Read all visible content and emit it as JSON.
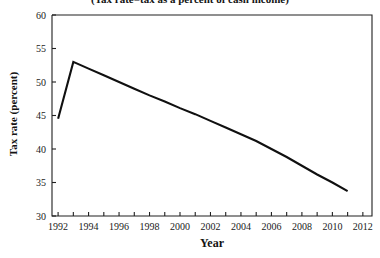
{
  "chart_data": {
    "type": "line",
    "title": "(Tax rate=tax as a percent of cash income)",
    "xlabel": "Year",
    "ylabel": "Tax rate (percent)",
    "xlim": [
      1991.6,
      2012.6
    ],
    "ylim": [
      30,
      60
    ],
    "yticks": [
      30,
      35,
      40,
      45,
      50,
      55,
      60
    ],
    "ytick_labels": [
      "30",
      "35",
      "40",
      "45",
      "50",
      "55",
      "60"
    ],
    "xticks": [
      1992,
      1993,
      1994,
      1995,
      1996,
      1997,
      1998,
      1999,
      2000,
      2001,
      2002,
      2003,
      2004,
      2005,
      2006,
      2007,
      2008,
      2009,
      2010,
      2011,
      2012
    ],
    "xtick_labels_shown": [
      "1992",
      "1994",
      "1996",
      "1998",
      "2000",
      "2002",
      "2004",
      "2006",
      "2008",
      "2010",
      "2012"
    ],
    "xtick_label_step": 2,
    "grid": false,
    "legend": false,
    "legend_position": "none",
    "line_color": "#101010",
    "series": [
      {
        "name": "Tax rate",
        "x": [
          1992,
          1993,
          1994,
          1995,
          1996,
          1997,
          1998,
          1999,
          2000,
          2001,
          2002,
          2003,
          2004,
          2005,
          2006,
          2007,
          2008,
          2009,
          2010,
          2011
        ],
        "values": [
          44.5,
          53.0,
          52.0,
          51.0,
          50.0,
          49.0,
          48.0,
          47.1,
          46.1,
          45.2,
          44.2,
          43.2,
          42.2,
          41.2,
          40.0,
          38.8,
          37.5,
          36.2,
          35.0,
          33.7
        ]
      }
    ]
  },
  "axes": {
    "y_axis_title": "Tax rate (percent)",
    "x_axis_title": "Year"
  }
}
